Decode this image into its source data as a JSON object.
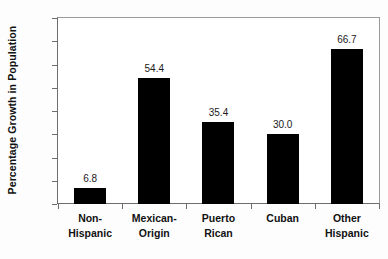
{
  "chart_data": {
    "type": "bar",
    "title": "",
    "xlabel": "",
    "ylabel": "Percentage Growth in Population",
    "ylim": [
      0,
      80
    ],
    "ytick_step": 10,
    "yticks": [
      "0",
      "10",
      "20",
      "30",
      "40",
      "50",
      "60",
      "70",
      "80"
    ],
    "grid": false,
    "legend": "none",
    "bar_color": "#000000",
    "categories": [
      "Non-Hispanic",
      "Mexican-Origin",
      "Puerto Rican",
      "Cuban",
      "Other Hispanic"
    ],
    "category_lines": [
      [
        "Non-",
        "Hispanic"
      ],
      [
        "Mexican-",
        "Origin"
      ],
      [
        "Puerto",
        "Rican"
      ],
      [
        "Cuban",
        ""
      ],
      [
        "Other",
        "Hispanic"
      ]
    ],
    "values": [
      6.8,
      54.4,
      35.4,
      30.0,
      66.7
    ],
    "data_labels": [
      "6.8",
      "54.4",
      "35.4",
      "30.0",
      "66.7"
    ]
  }
}
